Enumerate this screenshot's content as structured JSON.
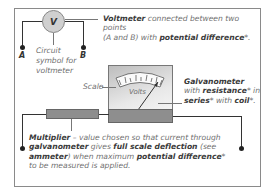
{
  "voltmeter": {
    "symbol_letter": "V",
    "point_a": "A",
    "point_b": "B",
    "symbol_caption_line1": "Circuit",
    "symbol_caption_line2": "symbol for",
    "symbol_caption_line3": "voltmeter",
    "desc_bold": "Voltmeter",
    "desc_text1": " connected between two points",
    "desc_text2": "(A and B) with ",
    "desc_bold2": "potential difference",
    "desc_end": "*."
  },
  "galvanometer": {
    "scale_label": "Scale",
    "dial_label": "Volts",
    "title": "Galvanometer",
    "line2_a": "with ",
    "line2_bold": "resistance",
    "line2_b": "* in",
    "line3_bold": "series",
    "line3_a": "* with ",
    "line3_bold2": "coil",
    "line3_end": "*."
  },
  "multiplier": {
    "bold1": "Multiplier",
    "t1": " – value chosen so that current through",
    "bold2": "galvanometer",
    "t2": " gives ",
    "bold3": "full scale deflection",
    "t3": " (see",
    "bold4": "ammeter",
    "t4": ") when maximum ",
    "bold5": "potential difference",
    "t5": "*",
    "t6": "to be measured is applied."
  },
  "colors": {
    "line": "#333333",
    "component_fill": "#8e8e8e",
    "text_gray": "#6f6f6f"
  }
}
